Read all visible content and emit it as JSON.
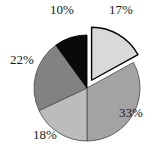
{
  "chart_data": {
    "type": "pie",
    "title": "",
    "subtitle": "",
    "xlabel": "",
    "ylabel": "",
    "grid": false,
    "legend": "none",
    "label_format": "percent",
    "start_angle_deg": 0,
    "direction": "clockwise",
    "center": {
      "x": 87,
      "y": 88
    },
    "radius": 53,
    "categories": [
      "17%",
      "33%",
      "18%",
      "22%",
      "10%"
    ],
    "values": [
      17,
      33,
      18,
      22,
      10
    ],
    "total": 100,
    "slices": [
      {
        "label": "17%",
        "value": 17,
        "color": "#d9d9d9",
        "edge_color": "#000000",
        "exploded": true,
        "explode_offset": 9,
        "label_x": 109,
        "label_y": 3
      },
      {
        "label": "33%",
        "value": 33,
        "color": "#a3a3a3",
        "edge_color": "#555555",
        "exploded": false,
        "explode_offset": 0,
        "label_x": 119,
        "label_y": 106
      },
      {
        "label": "18%",
        "value": 18,
        "color": "#bcbcbc",
        "edge_color": "#555555",
        "exploded": false,
        "explode_offset": 0,
        "label_x": 33,
        "label_y": 128
      },
      {
        "label": "22%",
        "value": 22,
        "color": "#828282",
        "edge_color": "#555555",
        "exploded": false,
        "explode_offset": 0,
        "label_x": 10,
        "label_y": 53
      },
      {
        "label": "10%",
        "value": 10,
        "color": "#0a0a0a",
        "edge_color": "#000000",
        "exploded": false,
        "explode_offset": 0,
        "label_x": 50,
        "label_y": 3
      }
    ],
    "background_color": "#ffffff",
    "text_color": "#1a1a1a"
  }
}
